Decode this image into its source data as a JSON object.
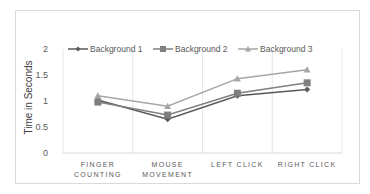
{
  "chart_data": {
    "type": "line",
    "title": "",
    "xlabel": "",
    "ylabel": "Time in Seconds",
    "categories": [
      "FINGER COUNTING",
      "MOUSE MOVEMENT",
      "LEFT CLICK",
      "RIGHT CLICK"
    ],
    "category_lines": [
      [
        "FINGER",
        "COUNTING"
      ],
      [
        "MOUSE",
        "MOVEMENT"
      ],
      [
        "LEFT CLICK"
      ],
      [
        "RIGHT CLICK"
      ]
    ],
    "series": [
      {
        "name": "Background 1",
        "marker": "diamond",
        "color": "#595959",
        "values": [
          1.02,
          0.65,
          1.1,
          1.22
        ]
      },
      {
        "name": "Background 2",
        "marker": "square",
        "color": "#7f7f7f",
        "values": [
          0.98,
          0.73,
          1.15,
          1.35
        ]
      },
      {
        "name": "Background 3",
        "marker": "triangle",
        "color": "#a6a6a6",
        "values": [
          1.1,
          0.9,
          1.43,
          1.6
        ]
      }
    ],
    "yticks": [
      "0",
      "0.5",
      "1",
      "1.5",
      "2"
    ],
    "ylim": [
      0,
      2
    ],
    "grid": "vertical",
    "legend_position": "top"
  }
}
